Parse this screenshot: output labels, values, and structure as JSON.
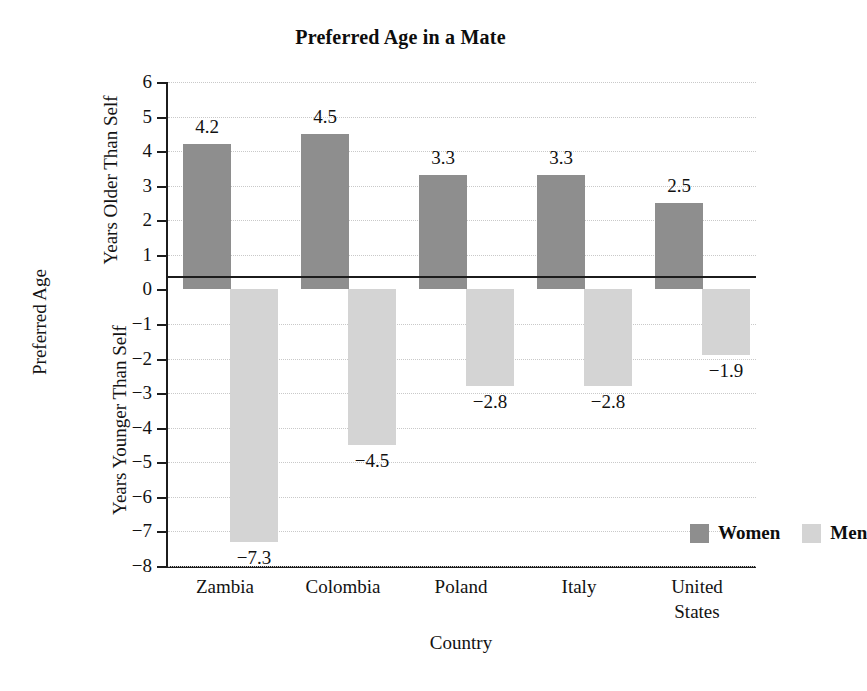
{
  "chart_data": {
    "type": "bar",
    "title": "Preferred Age in a Mate",
    "xlabel": "Country",
    "ylabel": "Preferred Age",
    "ylabel_upper": "Years Older Than Self",
    "ylabel_lower": "Years Younger Than Self",
    "categories": [
      "Zambia",
      "Colombia",
      "Poland",
      "Italy",
      "United States"
    ],
    "category_lines": [
      [
        "Zambia"
      ],
      [
        "Colombia"
      ],
      [
        "Poland"
      ],
      [
        "Italy"
      ],
      [
        "United",
        "States"
      ]
    ],
    "series": [
      {
        "name": "Women",
        "color": "#8e8e8e",
        "values": [
          4.2,
          4.5,
          3.3,
          3.3,
          2.5
        ],
        "labels": [
          "4.2",
          "4.5",
          "3.3",
          "3.3",
          "2.5"
        ]
      },
      {
        "name": "Men",
        "color": "#d4d4d4",
        "values": [
          -7.3,
          -4.5,
          -2.8,
          -2.8,
          -1.9
        ],
        "labels": [
          "−7.3",
          "−4.5",
          "−2.8",
          "−2.8",
          "−1.9"
        ]
      }
    ],
    "ylim": [
      -8,
      6
    ],
    "yticks": [
      6,
      5,
      4,
      3,
      2,
      1,
      0,
      -1,
      -2,
      -3,
      -4,
      -5,
      -6,
      -7,
      -8
    ],
    "ytick_labels": [
      "6",
      "5",
      "4",
      "3",
      "2",
      "1",
      "0",
      "−1",
      "−2",
      "−3",
      "−4",
      "−5",
      "−6",
      "−7",
      "−8"
    ],
    "grid": true,
    "grid_style": "dotted",
    "legend_position": "inside-lower-right",
    "legend": [
      "Women",
      "Men"
    ],
    "zero_line": 0,
    "background": "#ffffff"
  }
}
